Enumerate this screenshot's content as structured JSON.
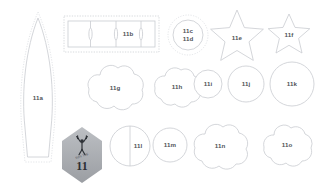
{
  "sheet": {
    "title": "Pattern piece layout sheet 11",
    "background": "#ffffff",
    "cut_line_color": "#c9ccd1",
    "seam_line_color": "#d7dade",
    "label_color": "#4f5358"
  },
  "badge": {
    "number": "11",
    "subtitle": "SOFTIE",
    "icon": "cheerleader-figure-icon",
    "fill_top": "#b9bcc0",
    "fill_bottom": "#9ea1a6"
  },
  "pieces": [
    {
      "id": "11a",
      "label": "11a",
      "shape": "tall-petal",
      "note": "long pointed leaf panel with dotted seam allowance"
    },
    {
      "id": "11b",
      "label": "11b",
      "shape": "segmented-strip",
      "note": "rectangular strip divided into four segments inside dashed box"
    },
    {
      "id": "11c",
      "label": "11c\n11d",
      "shape": "dotted-circle",
      "note": "circle with dotted outer seam ring, two part numbers"
    },
    {
      "id": "11e",
      "label": "11e",
      "shape": "star",
      "note": "large five point star"
    },
    {
      "id": "11f",
      "label": "11f",
      "shape": "star",
      "note": "small five point star"
    },
    {
      "id": "11g",
      "label": "11g",
      "shape": "cloud",
      "note": "large scalloped cloud"
    },
    {
      "id": "11h",
      "label": "11h",
      "shape": "cloud",
      "note": "medium scalloped cloud"
    },
    {
      "id": "11i",
      "label": "11i",
      "shape": "circle",
      "note": "small circle"
    },
    {
      "id": "11j",
      "label": "11j",
      "shape": "circle",
      "note": "medium circle"
    },
    {
      "id": "11k",
      "label": "11k",
      "shape": "circle",
      "note": "large circle"
    },
    {
      "id": "11l",
      "label": "11l",
      "shape": "circle-split",
      "note": "circle with vertical centre fold line"
    },
    {
      "id": "11m",
      "label": "11m",
      "shape": "circle",
      "note": "small circle"
    },
    {
      "id": "11n",
      "label": "11n",
      "shape": "cloud",
      "note": "wide scalloped cloud"
    },
    {
      "id": "11o",
      "label": "11o",
      "shape": "cloud",
      "note": "scalloped cloud"
    }
  ]
}
